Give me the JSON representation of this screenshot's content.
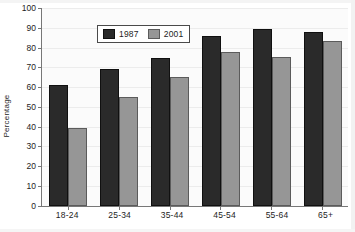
{
  "figure": {
    "clipped_title": "",
    "legend_position": "inside-top-left"
  },
  "chart_data": {
    "type": "bar",
    "title": "",
    "xlabel": "",
    "ylabel": "Percentage",
    "ylim": [
      0,
      100
    ],
    "ytick_step": 10,
    "ytick_labels": [
      "100",
      "90",
      "80",
      "70",
      "60",
      "50",
      "40",
      "30",
      "20",
      "10",
      "0"
    ],
    "yticks": [
      100,
      90,
      80,
      70,
      60,
      50,
      40,
      30,
      20,
      10,
      0
    ],
    "grid": true,
    "legend": [
      "1987",
      "2001"
    ],
    "categories": [
      "18-24",
      "25-34",
      "35-44",
      "45-54",
      "55-64",
      "65+"
    ],
    "series": [
      {
        "name": "1987",
        "color": "#2a2a2a",
        "values": [
          61,
          69.5,
          75,
          86,
          89.5,
          88
        ]
      },
      {
        "name": "2001",
        "color": "#969696",
        "values": [
          39.5,
          55,
          65,
          78,
          75.5,
          83.5
        ]
      }
    ]
  },
  "colors": {
    "series_1987": "#2a2a2a",
    "series_2001": "#969696",
    "plot_background": "#fbfbfb",
    "gridline": "#ececec",
    "axis": "#777777",
    "text": "#1d1d1d"
  }
}
